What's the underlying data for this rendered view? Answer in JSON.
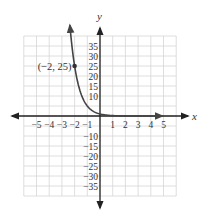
{
  "chart_data": {
    "type": "line",
    "title": "",
    "xlabel": "x",
    "ylabel": "y",
    "xlim": [
      -6,
      6
    ],
    "ylim": [
      -40,
      40
    ],
    "grid": true,
    "x_ticks": [
      -5,
      -4,
      -3,
      -2,
      -1,
      1,
      2,
      3,
      4,
      5
    ],
    "x_tick_labels": [
      "−5",
      "−4",
      "−3",
      "−2",
      "−1",
      "1",
      "2",
      "3",
      "4",
      "5"
    ],
    "y_ticks": [
      35,
      30,
      25,
      20,
      15,
      10,
      -10,
      -15,
      -20,
      -25,
      -30,
      -35
    ],
    "y_tick_labels": [
      "35",
      "30",
      "25",
      "20",
      "15",
      "10",
      "−10",
      "−15",
      "−20",
      "−25",
      "−30",
      "−35"
    ],
    "series": [
      {
        "name": "y = (1/5)^x",
        "x": [
          -2.35,
          -2,
          -1.5,
          -1,
          -0.5,
          0,
          1,
          2,
          3,
          4,
          5
        ],
        "y": [
          44,
          25,
          11.18,
          5,
          2.24,
          1,
          0.2,
          0.04,
          0.008,
          0.0016,
          0.0003
        ],
        "arrows": "both ends"
      }
    ],
    "annotations": [
      {
        "text": "(−2, 25)",
        "x": -2,
        "y": 25,
        "marker": "point"
      }
    ]
  }
}
